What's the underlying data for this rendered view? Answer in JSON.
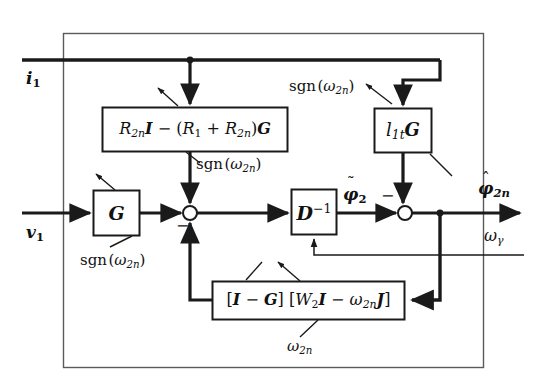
{
  "figure": {
    "type": "block-diagram",
    "background_color": "#ffffff",
    "line_color": "#1a1a1a",
    "outer_frame": {
      "x": 63,
      "y": 33,
      "width": 421,
      "height": 335
    }
  },
  "signals": {
    "input_current": "i",
    "input_current_sub": "1",
    "input_voltage": "v",
    "input_voltage_sub": "1",
    "intermediate_flux": "ϕ",
    "intermediate_flux_sub": "2",
    "output_flux": "ϕ",
    "output_flux_sub": "2n",
    "omega_gamma": "ω",
    "omega_gamma_sub": "γ"
  },
  "blocks": [
    {
      "id": "resistance-block",
      "name": "resistance-matrix-block",
      "x": 102,
      "y": 107,
      "width": 186,
      "height": 45,
      "font_size": 16,
      "text_parts": [
        {
          "t": "R",
          "style": "mi"
        },
        {
          "t": "2n",
          "style": "sub"
        },
        {
          "t": "I",
          "style": "mbi"
        },
        {
          "t": " − (",
          "style": "mup"
        },
        {
          "t": "R",
          "style": "mi"
        },
        {
          "t": "1",
          "style": "subup"
        },
        {
          "t": " + ",
          "style": "mup"
        },
        {
          "t": "R",
          "style": "mi"
        },
        {
          "t": "2n",
          "style": "sub"
        },
        {
          "t": ")",
          "style": "mup"
        },
        {
          "t": "G",
          "style": "mbi"
        }
      ],
      "plain": "R2nI − (R1 + R2n)G"
    },
    {
      "id": "l1t-g-block",
      "name": "inductance-gain-block",
      "x": 374,
      "y": 108,
      "width": 58,
      "height": 45,
      "font_size": 17,
      "text_parts": [
        {
          "t": "l",
          "style": "mi"
        },
        {
          "t": "1t",
          "style": "sub"
        },
        {
          "t": "G",
          "style": "mbi"
        }
      ],
      "plain": "l1tG"
    },
    {
      "id": "g-block",
      "name": "g-gain-block",
      "x": 93,
      "y": 190,
      "width": 47,
      "height": 46,
      "font_size": 18,
      "text_parts": [
        {
          "t": "G",
          "style": "mbi"
        }
      ],
      "plain": "G"
    },
    {
      "id": "d-inverse-block",
      "name": "d-inverse-block",
      "x": 291,
      "y": 189,
      "width": 46,
      "height": 46,
      "font_size": 18,
      "text_parts": [
        {
          "t": "D",
          "style": "mbi"
        },
        {
          "t": "−1",
          "style": "sup"
        }
      ],
      "plain": "D⁻¹"
    },
    {
      "id": "feedback-block",
      "name": "feedback-matrix-block",
      "x": 212,
      "y": 281,
      "width": 193,
      "height": 39,
      "font_size": 16,
      "text_parts": [
        {
          "t": "[",
          "style": "mup"
        },
        {
          "t": "I",
          "style": "mbi"
        },
        {
          "t": " − ",
          "style": "mup"
        },
        {
          "t": "G",
          "style": "mbi"
        },
        {
          "t": "] [",
          "style": "mup"
        },
        {
          "t": "W",
          "style": "mi"
        },
        {
          "t": "2",
          "style": "subup"
        },
        {
          "t": "I",
          "style": "mbi"
        },
        {
          "t": " − ",
          "style": "mup"
        },
        {
          "t": "ω",
          "style": "mi"
        },
        {
          "t": "2n",
          "style": "sub"
        },
        {
          "t": "J",
          "style": "mbi"
        },
        {
          "t": "]",
          "style": "mup"
        }
      ],
      "plain": "[I − G] [W2I − ω2nJ]"
    }
  ],
  "annotations": [
    {
      "id": "sgn-top-left",
      "name": "sgn-label-resistance-block",
      "text": "sgn(ω2n)",
      "omega_sub": "2n",
      "x": 196,
      "y": 166,
      "font_size": 15
    },
    {
      "id": "sgn-top-right",
      "name": "sgn-label-l1t-block",
      "text": "sgn(ω2n)",
      "omega_sub": "2n",
      "x": 289,
      "y": 79,
      "font_size": 15
    },
    {
      "id": "sgn-bottom-left",
      "name": "sgn-label-g-block",
      "text": "sgn(ω2n)",
      "omega_sub": "2n",
      "x": 80,
      "y": 253,
      "font_size": 15
    },
    {
      "id": "omega-2n-bottom",
      "name": "omega-2n-label-feedback",
      "text": "ω2n",
      "omega_sub": "2n",
      "x": 287,
      "y": 339,
      "font_size": 15
    }
  ],
  "signs": [
    {
      "id": "minus-junction-1",
      "name": "minus-sign-junction-left",
      "text": "−",
      "x": 178,
      "y": 219
    },
    {
      "id": "minus-junction-2",
      "name": "minus-sign-junction-right",
      "text": "−",
      "x": 383,
      "y": 192
    }
  ],
  "junctions": [
    {
      "id": "sum-1",
      "name": "summing-junction-left",
      "cx": 190,
      "cy": 213,
      "r": 7
    },
    {
      "id": "sum-2",
      "name": "summing-junction-right",
      "cx": 405,
      "cy": 213,
      "r": 7
    }
  ],
  "nodes": [
    {
      "id": "node-i1",
      "name": "node-current-branch",
      "cx": 190,
      "cy": 60,
      "r": 3.2
    },
    {
      "id": "node-output",
      "name": "node-output-branch",
      "cx": 440,
      "cy": 213,
      "r": 3.2
    }
  ]
}
